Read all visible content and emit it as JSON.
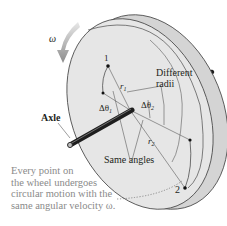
{
  "diagram": {
    "type": "rotating-wheel-on-axle",
    "labels": {
      "omega_arrow": "ω",
      "point_1": "1",
      "point_2": "2",
      "r1": "r",
      "r1_sub": "1",
      "r2": "r",
      "r2_sub": "2",
      "dtheta1": "Δθ",
      "dtheta1_sub": "1",
      "dtheta2": "Δθ",
      "dtheta2_sub": "2",
      "different_radii_line1": "Different",
      "different_radii_line2": "radii",
      "axle": "Axle",
      "same_angles": "Same angles"
    },
    "caption": {
      "line1": "Every point on",
      "line2": "the wheel undergoes",
      "line3": "circular motion with the",
      "line4": "same angular velocity ω."
    },
    "colors": {
      "wheel_face": "#e6e6e6",
      "wheel_rim": "#d4d4d4",
      "outline": "#4a4a4a",
      "axle": "#1e1e1e",
      "arrow": "#9a9a9a",
      "caption_text": "#8a8a8a",
      "label_text": "#231f20"
    }
  }
}
